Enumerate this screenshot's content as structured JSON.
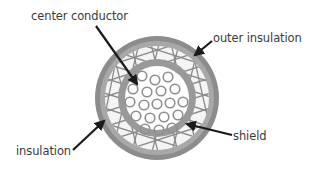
{
  "labels": {
    "center_conductor": "center conductor",
    "outer_insulation": "outer insulation",
    "insulation": "insulation",
    "shield": "shield"
  },
  "colors": {
    "outer_jacket": "#8a8a8a",
    "shield_mesh_bg": "#f2f2f2",
    "shield_lines": "#8a8a8a",
    "inner_insulation": "#9a9a9a",
    "conductor_bg": "#ffffff",
    "strand": "#909090",
    "arrow": "#1a1a1a",
    "text": "#3a3a3a"
  }
}
